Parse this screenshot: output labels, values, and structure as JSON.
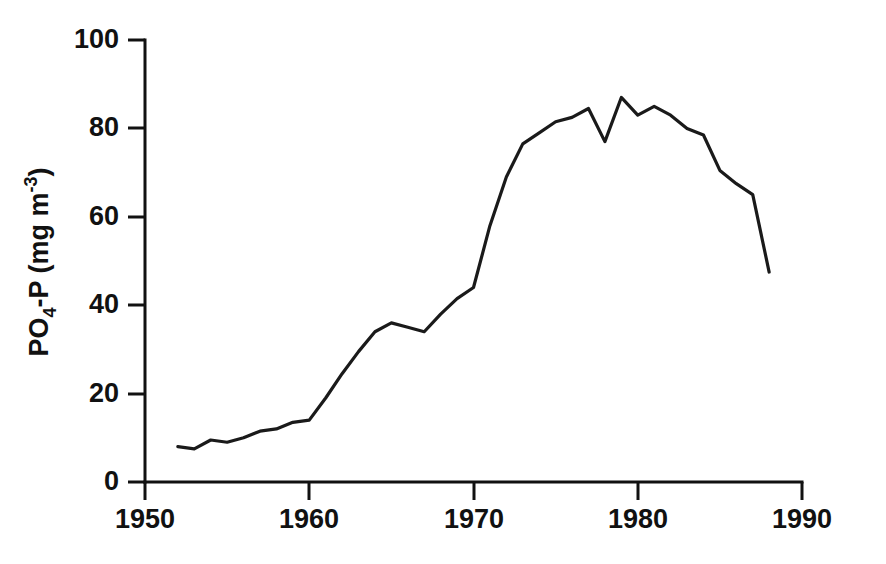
{
  "chart_data": {
    "type": "line",
    "title": "",
    "subtitle": "",
    "xlabel": "",
    "ylabel_parts": {
      "main_1": "PO",
      "sub_1": "4",
      "main_2": "-P  (mg m",
      "sup_1": "-3",
      "main_3": ")"
    },
    "ylabel": "PO4-P (mg m-3)",
    "xlim": [
      1950,
      1990
    ],
    "ylim": [
      0,
      100
    ],
    "xticks": [
      1950,
      1960,
      1970,
      1980,
      1990
    ],
    "xtick_labels": [
      "1950",
      "1960",
      "1970",
      "1980",
      "1990"
    ],
    "yticks": [
      0,
      20,
      40,
      60,
      80,
      100
    ],
    "ytick_labels": [
      "0",
      "20",
      "40",
      "60",
      "80",
      "100"
    ],
    "grid": false,
    "legend": null,
    "legend_position": "none",
    "series": [
      {
        "name": "PO4-P",
        "color": "#1a1a1a",
        "x": [
          1952,
          1953,
          1954,
          1955,
          1956,
          1957,
          1958,
          1959,
          1960,
          1961,
          1962,
          1963,
          1964,
          1965,
          1966,
          1967,
          1968,
          1969,
          1970,
          1971,
          1972,
          1973,
          1974,
          1975,
          1976,
          1977,
          1978,
          1979,
          1980,
          1981,
          1982,
          1983,
          1984,
          1985,
          1986,
          1987,
          1988
        ],
        "values": [
          8.0,
          7.5,
          9.5,
          9.0,
          10.0,
          11.5,
          12.0,
          13.5,
          14.0,
          19.0,
          24.5,
          29.5,
          34.0,
          36.0,
          35.0,
          34.0,
          38.0,
          41.5,
          44.0,
          58.0,
          69.0,
          76.5,
          79.0,
          81.5,
          82.5,
          84.5,
          77.0,
          87.0,
          83.0,
          85.0,
          83.0,
          80.0,
          78.5,
          70.5,
          67.5,
          65.0,
          47.5
        ]
      }
    ]
  },
  "figure": {
    "axis_color": "#111111",
    "background": "#ffffff"
  }
}
